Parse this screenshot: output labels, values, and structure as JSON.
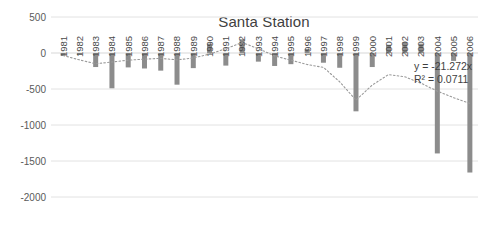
{
  "chart_data": {
    "type": "bar",
    "title": "Santa Station",
    "xlabel": "",
    "ylabel": "",
    "ylim": [
      -2000,
      500
    ],
    "yticks": [
      500,
      0,
      -500,
      -1000,
      -1500,
      -2000
    ],
    "ytick_labels": [
      "500",
      "0",
      "-500",
      "-1000",
      "-1500",
      "-2000"
    ],
    "grid": true,
    "legend": "none",
    "categories": [
      "1981",
      "1982",
      "1983",
      "1984",
      "1985",
      "1986",
      "1987",
      "1988",
      "1989",
      "1990",
      "1991",
      "1992",
      "1993",
      "1994",
      "1995",
      "1996",
      "1997",
      "1998",
      "1999",
      "2000",
      "2001",
      "2002",
      "2003",
      "2004",
      "2005",
      "2006"
    ],
    "values": [
      -40,
      -25,
      -195,
      -490,
      -200,
      -215,
      -245,
      -440,
      -210,
      130,
      -175,
      190,
      -120,
      -180,
      -155,
      55,
      -135,
      -205,
      -810,
      -195,
      115,
      150,
      130,
      -1395,
      -110,
      -1660
    ],
    "series": [
      {
        "name": "Santa Station",
        "values": [
          -40,
          -25,
          -195,
          -490,
          -200,
          -215,
          -245,
          -440,
          -210,
          130,
          -175,
          190,
          -120,
          -180,
          -155,
          55,
          -135,
          -205,
          -810,
          -195,
          115,
          150,
          130,
          -1395,
          -110,
          -1660
        ]
      }
    ],
    "trendline": {
      "type": "polynomial",
      "equation": "y = -21.272x",
      "r_squared": "R² = 0.0711",
      "slope": -21.272,
      "r2_value": 0.0711,
      "points": [
        -35,
        -95,
        -150,
        -125,
        -100,
        -85,
        -75,
        -95,
        -70,
        -15,
        60,
        145,
        60,
        -40,
        -100,
        -160,
        -200,
        -400,
        -655,
        -445,
        -300,
        -330,
        -420,
        -530,
        -620,
        -700
      ]
    },
    "colors": {
      "bar": "#8c8c8c",
      "trendline": "#9a9a9a",
      "gridline": "#e2e2e2",
      "title": "#3f3f3f",
      "tick_text": "#5a5a5a",
      "background": "#ffffff"
    }
  }
}
